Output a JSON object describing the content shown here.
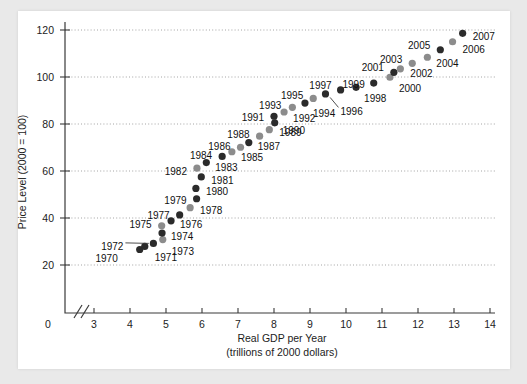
{
  "chart_data": {
    "type": "scatter",
    "title": "",
    "xlabel": "Real GDP per Year",
    "xlabel_sub": "(trillions of 2000 dollars)",
    "ylabel": "Price Level (2000 = 100)",
    "xlim": [
      2.4,
      14.4
    ],
    "ylim": [
      10,
      126
    ],
    "x_ticks": [
      3,
      4,
      5,
      6,
      7,
      8,
      9,
      10,
      11,
      12,
      13,
      14
    ],
    "x_origin_tick": 0,
    "x_axis_break": true,
    "y_ticks": [
      20,
      40,
      60,
      80,
      100,
      120
    ],
    "grid": "horizontal-dotted",
    "legend": "none",
    "marker_colors": {
      "dark": "#2b2b2b",
      "light": "#8c8c8c"
    },
    "points": [
      {
        "label": "1970",
        "x": 4.27,
        "y": 26.6,
        "shade": "dark",
        "lx": -22,
        "ly": 9,
        "anchor": "end"
      },
      {
        "label": "1971",
        "x": 4.41,
        "y": 27.9,
        "shade": "dark",
        "lx": 10,
        "ly": 11,
        "anchor": "start"
      },
      {
        "label": "1972",
        "x": 4.65,
        "y": 29.2,
        "shade": "dark",
        "lx": -30,
        "ly": 3,
        "anchor": "end",
        "leader": true
      },
      {
        "label": "1973",
        "x": 4.91,
        "y": 30.8,
        "shade": "light",
        "lx": 9,
        "ly": 12,
        "anchor": "start"
      },
      {
        "label": "1974",
        "x": 4.89,
        "y": 33.6,
        "shade": "dark",
        "lx": 9,
        "ly": 3,
        "anchor": "start"
      },
      {
        "label": "1975",
        "x": 4.88,
        "y": 36.7,
        "shade": "light",
        "lx": -10,
        "ly": -1,
        "anchor": "end"
      },
      {
        "label": "1976",
        "x": 5.14,
        "y": 38.8,
        "shade": "dark",
        "lx": 9,
        "ly": 4,
        "anchor": "start"
      },
      {
        "label": "1977",
        "x": 5.38,
        "y": 41.3,
        "shade": "dark",
        "lx": -10,
        "ly": 0,
        "anchor": "end"
      },
      {
        "label": "1978",
        "x": 5.67,
        "y": 44.4,
        "shade": "light",
        "lx": 10,
        "ly": 3,
        "anchor": "start"
      },
      {
        "label": "1979",
        "x": 5.85,
        "y": 48.2,
        "shade": "dark",
        "lx": -10,
        "ly": 2,
        "anchor": "end"
      },
      {
        "label": "1980",
        "x": 5.83,
        "y": 52.6,
        "shade": "dark",
        "lx": 10,
        "ly": 3,
        "anchor": "start"
      },
      {
        "label": "1981",
        "x": 5.98,
        "y": 57.5,
        "shade": "dark",
        "lx": 10,
        "ly": 4,
        "anchor": "start"
      },
      {
        "label": "1982",
        "x": 5.86,
        "y": 61.2,
        "shade": "light",
        "lx": -10,
        "ly": 3,
        "anchor": "end"
      },
      {
        "label": "1983",
        "x": 6.12,
        "y": 63.6,
        "shade": "dark",
        "lx": 9,
        "ly": 5,
        "anchor": "start"
      },
      {
        "label": "1984",
        "x": 6.56,
        "y": 66.2,
        "shade": "dark",
        "lx": -10,
        "ly": -1,
        "anchor": "end"
      },
      {
        "label": "1985",
        "x": 6.83,
        "y": 68.2,
        "shade": "light",
        "lx": 9,
        "ly": 6,
        "anchor": "start"
      },
      {
        "label": "1986",
        "x": 7.07,
        "y": 70.1,
        "shade": "light",
        "lx": -10,
        "ly": -1,
        "anchor": "end"
      },
      {
        "label": "1987",
        "x": 7.3,
        "y": 72.1,
        "shade": "dark",
        "lx": 9,
        "ly": 4,
        "anchor": "start"
      },
      {
        "label": "1988",
        "x": 7.6,
        "y": 74.8,
        "shade": "light",
        "lx": -10,
        "ly": -2,
        "anchor": "end"
      },
      {
        "label": "1989",
        "x": 7.87,
        "y": 77.6,
        "shade": "light",
        "lx": 10,
        "ly": 3,
        "anchor": "start"
      },
      {
        "label": "1990",
        "x": 8.02,
        "y": 80.5,
        "shade": "dark",
        "lx": 8,
        "ly": 8,
        "anchor": "start"
      },
      {
        "label": "1991",
        "x": 8.0,
        "y": 83.3,
        "shade": "dark",
        "lx": -10,
        "ly": 1,
        "anchor": "end"
      },
      {
        "label": "1992",
        "x": 8.28,
        "y": 85.1,
        "shade": "light",
        "lx": 9,
        "ly": 6,
        "anchor": "start"
      },
      {
        "label": "1993",
        "x": 8.51,
        "y": 87.1,
        "shade": "light",
        "lx": -11,
        "ly": -2,
        "anchor": "end"
      },
      {
        "label": "1994",
        "x": 8.86,
        "y": 88.9,
        "shade": "dark",
        "lx": 8,
        "ly": 10,
        "anchor": "start"
      },
      {
        "label": "1995",
        "x": 9.09,
        "y": 90.9,
        "shade": "light",
        "lx": -10,
        "ly": -3,
        "anchor": "end"
      },
      {
        "label": "1996",
        "x": 9.43,
        "y": 92.8,
        "shade": "dark",
        "lx": 15,
        "ly": 17,
        "anchor": "start",
        "leader": true
      },
      {
        "label": "1997",
        "x": 9.85,
        "y": 94.5,
        "shade": "dark",
        "lx": -9,
        "ly": -5,
        "anchor": "end"
      },
      {
        "label": "1998",
        "x": 10.28,
        "y": 95.6,
        "shade": "dark",
        "lx": 8,
        "ly": 11,
        "anchor": "start"
      },
      {
        "label": "1999",
        "x": 10.77,
        "y": 97.4,
        "shade": "dark",
        "lx": -9,
        "ly": 1,
        "anchor": "end"
      },
      {
        "label": "2000",
        "x": 11.22,
        "y": 99.9,
        "shade": "light",
        "lx": 9,
        "ly": 11,
        "anchor": "start"
      },
      {
        "label": "2001",
        "x": 11.33,
        "y": 102.0,
        "shade": "dark",
        "lx": -10,
        "ly": -5,
        "anchor": "end"
      },
      {
        "label": "2002",
        "x": 11.51,
        "y": 103.5,
        "shade": "light",
        "lx": 10,
        "ly": 5,
        "anchor": "start"
      },
      {
        "label": "2003",
        "x": 11.84,
        "y": 105.8,
        "shade": "light",
        "lx": -10,
        "ly": -4,
        "anchor": "end"
      },
      {
        "label": "2004",
        "x": 12.26,
        "y": 108.4,
        "shade": "light",
        "lx": 9,
        "ly": 6,
        "anchor": "start"
      },
      {
        "label": "2005",
        "x": 12.62,
        "y": 111.6,
        "shade": "dark",
        "lx": -10,
        "ly": -4,
        "anchor": "end"
      },
      {
        "label": "2006",
        "x": 12.96,
        "y": 115.0,
        "shade": "light",
        "lx": 10,
        "ly": 8,
        "anchor": "start"
      },
      {
        "label": "2007",
        "x": 13.24,
        "y": 118.6,
        "shade": "dark",
        "lx": 10,
        "ly": 3,
        "anchor": "start"
      }
    ]
  },
  "axes": {
    "x_tick_labels": [
      "3",
      "4",
      "5",
      "6",
      "7",
      "8",
      "9",
      "10",
      "11",
      "12",
      "13",
      "14"
    ],
    "x_origin_label": "0",
    "y_tick_labels": [
      "20",
      "40",
      "60",
      "80",
      "100",
      "120"
    ],
    "x_title": "Real GDP per Year",
    "x_subtitle": "(trillions of 2000 dollars)",
    "y_title": "Price Level (2000 = 100)"
  }
}
